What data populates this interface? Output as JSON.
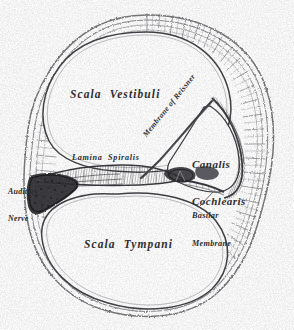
{
  "figure": {
    "style": "engraving",
    "background_color": "#fdfdfd",
    "ink_color": "#2e2e30",
    "width": 294,
    "height": 330
  },
  "labels": {
    "scala_vestibuli": "Scala  Vestibuli",
    "scala_tympani": "Scala  Tympani",
    "canalis_cochlearis_line1": "Canalis",
    "canalis_cochlearis_line2": "Cochlearis",
    "lamina_spiralis": "Lamina  Spiralis",
    "auditory_nerve_line1": "Auditory",
    "auditory_nerve_line2": "Nerve",
    "basilar_membrane_line1": "Basilar",
    "basilar_membrane_line2": "Membrane",
    "membrane_of_reissner": "Membrane of Reissner"
  },
  "structures": [
    {
      "name": "scala-vestibuli",
      "kind": "chamber",
      "position": "upper-left"
    },
    {
      "name": "scala-tympani",
      "kind": "chamber",
      "position": "lower-left"
    },
    {
      "name": "canalis-cochlearis",
      "kind": "chamber",
      "position": "right-middle"
    },
    {
      "name": "osseous-wall",
      "kind": "bone",
      "position": "perimeter"
    },
    {
      "name": "lamina-spiralis",
      "kind": "shelf",
      "position": "center-left"
    },
    {
      "name": "auditory-nerve",
      "kind": "nerve-bundle",
      "position": "left-middle"
    },
    {
      "name": "membrane-of-reissner",
      "kind": "membrane",
      "position": "center-right-diagonal"
    },
    {
      "name": "basilar-membrane",
      "kind": "membrane",
      "position": "center-right"
    },
    {
      "name": "organ-of-corti",
      "kind": "sensory-organ",
      "position": "center-right"
    },
    {
      "name": "stria-vascularis",
      "kind": "tissue",
      "position": "right-wall"
    }
  ]
}
